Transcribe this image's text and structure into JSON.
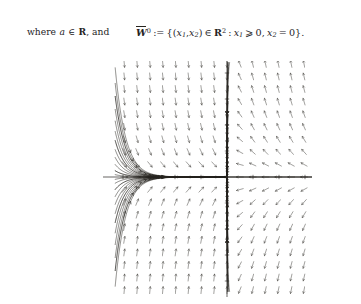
{
  "page": {
    "background": "#ffffff",
    "ink": "#26241f"
  },
  "text": {
    "lhs": {
      "prefix": "where",
      "var": "a",
      "member": "∈",
      "set": "R",
      "suffix": ", and"
    },
    "formula": {
      "lhs_symbol": "W",
      "lhs_overline": true,
      "lhs_superscript": "0",
      "defined_as": ":=",
      "open_brace": "{",
      "tuple_open": "(",
      "tuple_var1": "x",
      "tuple_sub1": "1",
      "tuple_comma": ",",
      "tuple_var2": "x",
      "tuple_sub2": "2",
      "tuple_close": ")",
      "member": "∈",
      "space": "R",
      "space_exp": "2",
      "colon": ":",
      "cond1_var": "x",
      "cond1_sub": "1",
      "cond1_rel": "⩾",
      "cond1_val": "0",
      "cond_comma": ",",
      "cond2_var": "x",
      "cond2_sub": "2",
      "cond2_rel": "=",
      "cond2_val": "0",
      "close_brace": "}",
      "period": "."
    }
  },
  "chart_data": {
    "type": "line",
    "title": "",
    "xlabel": "",
    "ylabel": "",
    "xlim": [
      -4,
      4
    ],
    "ylim": [
      -4.5,
      4.5
    ],
    "grid": false,
    "legend": null,
    "axes": {
      "x_axis_y": 0,
      "y_axis_x": 0,
      "x_tick_count": 8,
      "y_tick_count": 9,
      "axis_color": "#26241f"
    },
    "critical_points": [
      {
        "x": 0,
        "y": 0,
        "type": "degenerate-saddle-node"
      }
    ],
    "invariant_sets": [
      {
        "name": "W0bar",
        "curve": "x2 = 0, x1 >= 0"
      }
    ],
    "series": [
      {
        "name": "streamlines-quadrant-II",
        "direction": "inward",
        "count": 12
      },
      {
        "name": "streamlines-quadrant-III",
        "direction": "inward",
        "count": 12
      },
      {
        "name": "streamlines-quadrant-I",
        "direction": "outward",
        "count": 12
      },
      {
        "name": "streamlines-quadrant-IV",
        "direction": "outward",
        "count": 12
      },
      {
        "name": "direction-field-arrows",
        "direction": "mixed",
        "count": 260
      }
    ]
  },
  "plot": {
    "left": 103,
    "top": 61,
    "width": 209,
    "height": 236,
    "origin_px": {
      "x": 124,
      "y": 116
    }
  }
}
